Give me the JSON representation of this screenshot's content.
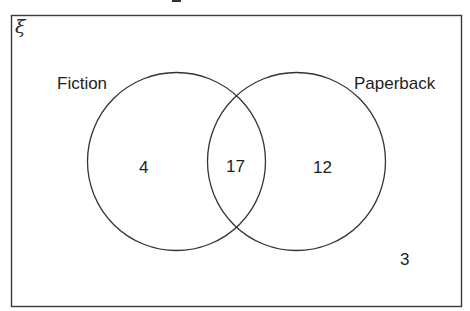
{
  "diagram": {
    "type": "venn",
    "universal_set_symbol": "ξ",
    "sets": [
      {
        "id": "fiction",
        "label": "Fiction"
      },
      {
        "id": "paperback",
        "label": "Paperback"
      }
    ],
    "regions": {
      "fiction_only": "4",
      "both": "17",
      "paperback_only": "12",
      "neither": "3"
    }
  }
}
